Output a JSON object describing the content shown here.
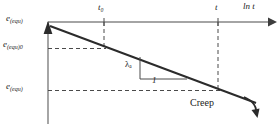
{
  "figure": {
    "type": "schematic-line-diagram",
    "title_text": "",
    "axes": {
      "x_axis": {
        "label": "ln t",
        "label_name": "ln-t-axis-label",
        "orientation": "horizontal-top",
        "arrow": "right",
        "ticks": [
          {
            "label": "t₀",
            "plain": "t0",
            "x_px": 104
          },
          {
            "label": "t",
            "plain": "t",
            "x_px": 218
          }
        ]
      },
      "y_axis": {
        "orientation": "vertical-left",
        "arrow": "up",
        "ticks": [
          {
            "label": "e(equ)",
            "base": "e",
            "sub": "(equ)",
            "y_px": 22
          },
          {
            "label": "e(equ)0",
            "base": "e",
            "sub": "(equ)0",
            "y_px": 48
          },
          {
            "label": "e(equ)",
            "base": "e",
            "sub": "(equ)",
            "y_px": 90
          }
        ]
      }
    },
    "curve": {
      "name": "creep-line",
      "description": "straight declining line with curved arrow head at lower right",
      "start": [
        50,
        26
      ],
      "end": [
        258,
        104
      ],
      "style": "solid",
      "arrow": "curved-down-right"
    },
    "slope_triangle": {
      "rise_label": "λₐ",
      "rise_label_plain": "lambda_a",
      "run_label": "1",
      "apex": [
        140,
        60
      ],
      "corner": [
        140,
        80
      ],
      "run_end": [
        185,
        80
      ]
    },
    "annotations": [
      {
        "name": "creep-annotation",
        "text": "Creep",
        "x_px": 190,
        "y_px": 98
      }
    ],
    "guides": [
      {
        "name": "t0-vertical-dashed",
        "from": [
          104,
          22
        ],
        "to": [
          104,
          48
        ]
      },
      {
        "name": "t-vertical-dashed",
        "from": [
          218,
          22
        ],
        "to": [
          218,
          90
        ]
      },
      {
        "name": "equ0-horizontal-dashed",
        "from": [
          48,
          48
        ],
        "to": [
          104,
          48
        ]
      },
      {
        "name": "equ-horizontal-dashed",
        "from": [
          48,
          90
        ],
        "to": [
          218,
          90
        ]
      }
    ],
    "colors": {
      "stroke": "#3d3d3d",
      "line": "#2b2b2b",
      "dash": "#4a4a4a",
      "text": "#1b1b1b",
      "background": "#ffffff"
    }
  }
}
